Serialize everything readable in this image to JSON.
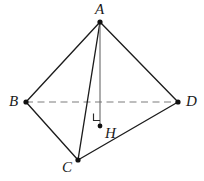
{
  "figure": {
    "kind": "tetrahedron-diagram",
    "width": 204,
    "height": 181,
    "background_color": "#ffffff",
    "stroke_color": "#1c1c1c",
    "dashed_color": "#a8a8a8",
    "altitude_color": "#6f6f6f",
    "vertex_dot_color": "#111111",
    "label_color": "#1a1a1a"
  },
  "vertices": [
    {
      "id": "A",
      "label": "A",
      "x": 100,
      "y": 22,
      "label_x": 95,
      "label_y": 2,
      "dot_r": 2.6
    },
    {
      "id": "B",
      "label": "B",
      "x": 26,
      "y": 102,
      "label_x": 9,
      "label_y": 94,
      "dot_r": 2.6
    },
    {
      "id": "C",
      "label": "C",
      "x": 78,
      "y": 160,
      "label_x": 62,
      "label_y": 160,
      "dot_r": 2.6
    },
    {
      "id": "D",
      "label": "D",
      "x": 178,
      "y": 102,
      "label_x": 186,
      "label_y": 94,
      "dot_r": 2.6
    },
    {
      "id": "H",
      "label": "H",
      "x": 100,
      "y": 126,
      "label_x": 105,
      "label_y": 126,
      "dot_r": 2.4
    }
  ],
  "edges": [
    {
      "id": "AB",
      "from": "A",
      "to": "B",
      "style": "solid",
      "x1": 100,
      "y1": 22,
      "x2": 26,
      "y2": 102
    },
    {
      "id": "AC",
      "from": "A",
      "to": "C",
      "style": "solid",
      "x1": 100,
      "y1": 22,
      "x2": 78,
      "y2": 160
    },
    {
      "id": "AD",
      "from": "A",
      "to": "D",
      "style": "solid",
      "x1": 100,
      "y1": 22,
      "x2": 178,
      "y2": 102
    },
    {
      "id": "BC",
      "from": "B",
      "to": "C",
      "style": "solid",
      "x1": 26,
      "y1": 102,
      "x2": 78,
      "y2": 160
    },
    {
      "id": "CD",
      "from": "C",
      "to": "D",
      "style": "solid",
      "x1": 78,
      "y1": 160,
      "x2": 178,
      "y2": 102
    },
    {
      "id": "BD",
      "from": "B",
      "to": "D",
      "style": "dashed",
      "x1": 26,
      "y1": 102,
      "x2": 178,
      "y2": 102
    },
    {
      "id": "AH",
      "from": "A",
      "to": "H",
      "style": "altitude",
      "x1": 100,
      "y1": 22,
      "x2": 100,
      "y2": 124
    }
  ],
  "right_angle": {
    "at": "H",
    "path": "M 93.5,113.5 L 93.5,120.5 L 100,120.5",
    "name": "right-angle-at-H"
  }
}
